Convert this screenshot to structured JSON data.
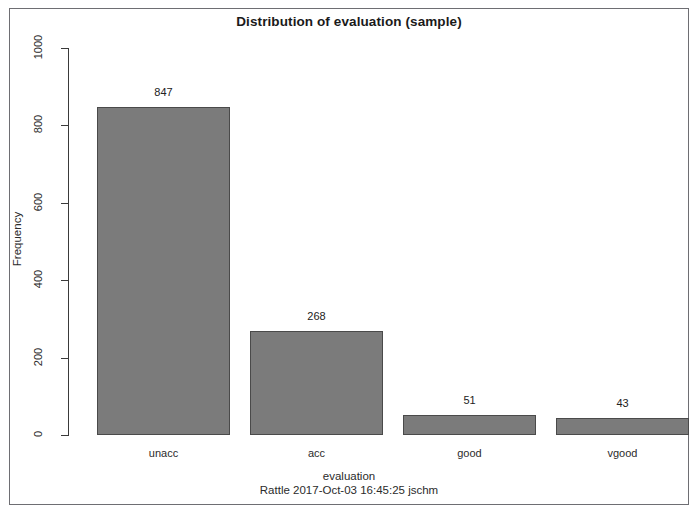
{
  "chart_data": {
    "type": "bar",
    "title": "Distribution of evaluation (sample)",
    "xlabel": "evaluation",
    "ylabel": "Frequency",
    "categories": [
      "unacc",
      "acc",
      "good",
      "vgood"
    ],
    "values": [
      847,
      268,
      51,
      43
    ],
    "value_labels": [
      "847",
      "268",
      "51",
      "43"
    ],
    "ylim": [
      0,
      1000
    ],
    "yticks": [
      0,
      200,
      400,
      600,
      800,
      1000
    ],
    "ytick_labels": [
      "0",
      "200",
      "400",
      "600",
      "800",
      "1000"
    ],
    "grid": false,
    "legend": null,
    "annotations": [
      "Rattle 2017-Oct-03 16:45:25 jschm"
    ],
    "bar_color": "#7b7b7b",
    "bar_border_color": "#4a4a4a"
  },
  "footer": {
    "stamp": "Rattle 2017-Oct-03 16:45:25 jschm"
  },
  "colors": {
    "background": "#ffffff",
    "frame": "#6e6e73",
    "axis": "#3a3a3a",
    "text": "#2b2b2b"
  }
}
